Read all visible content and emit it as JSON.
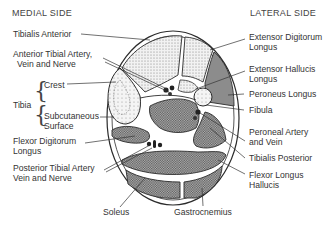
{
  "headers": {
    "medial": "MEDIAL SIDE",
    "lateral": "LATERAL SIDE"
  },
  "labels_left": {
    "tibialis_anterior": "Tibialis Anterior",
    "ant_tibial_line1": "Anterior Tibial Artery,",
    "ant_tibial_line2": "Vein and Nerve",
    "tibia": "Tibia",
    "crest": "Crest",
    "subcut_line1": "Subcutaneous",
    "subcut_line2": "Surface",
    "fdl_line1": "Flexor Digitorum",
    "fdl_line2": "Longus",
    "post_tibial_line1": "Posterior Tibial Artery",
    "post_tibial_line2": "Vein and Nerve"
  },
  "labels_right": {
    "edl_line1": "Extensor Digitorum",
    "edl_line2": "Longus",
    "ehl_line1": "Extensor Hallucis",
    "ehl_line2": "Longus",
    "peroneus_longus": "Peroneus Longus",
    "fibula": "Fibula",
    "peroneal_line1": "Peroneal Artery",
    "peroneal_line2": "and Vein",
    "tibialis_posterior": "Tibialis Posterior",
    "fhl_line1": "Flexor Longus",
    "fhl_line2": "Hallucis"
  },
  "labels_bottom": {
    "soleus": "Soleus",
    "gastrocnemius": "Gastrocnemius"
  },
  "colors": {
    "outline": "#2b2b2b",
    "light_stipple": "#d9d9d9",
    "dark_crosshatch": "#8f8f8f",
    "peroneus_fill": "#8a8a8a",
    "bone_fill": "#ececec"
  }
}
